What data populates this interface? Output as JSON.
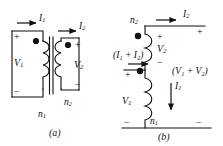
{
  "figure": {
    "title_hidden": "",
    "stroke_color": "#111111",
    "background": "#ffffff",
    "panels": [
      {
        "id": "panel-a",
        "caption": "(a)",
        "description": "Two-winding transformer with primary and secondary windings on a common core",
        "labels": {
          "current_primary": "I",
          "current_primary_sub": "1",
          "current_secondary": "I",
          "current_secondary_sub": "2",
          "voltage_primary": "V",
          "voltage_primary_sub": "1",
          "voltage_secondary": "V",
          "voltage_secondary_sub": "2",
          "turns_primary": "n",
          "turns_primary_sub": "1",
          "turns_secondary": "n",
          "turns_secondary_sub": "2",
          "plus_primary": "+",
          "minus_primary": "−",
          "plus_secondary": "+",
          "minus_secondary": "−"
        }
      },
      {
        "id": "panel-b",
        "caption": "(b)",
        "description": "Autotransformer connection with series-aiding windings",
        "labels": {
          "turns_upper": "n",
          "turns_upper_sub": "2",
          "turns_lower": "n",
          "turns_lower_sub": "1",
          "current_out": "I",
          "current_out_sub": "2",
          "current_in": "(I₁ + I₂)",
          "current_lower": "I",
          "current_lower_sub": "1",
          "voltage_upper": "V",
          "voltage_upper_sub": "2",
          "voltage_lower": "V",
          "voltage_lower_sub": "1",
          "voltage_total": "(V₁ + V₂)",
          "plus_top": "+",
          "plus_upper_coil": "+",
          "minus_upper_coil": "−",
          "plus_mid": "+",
          "minus_bottom_left": "−",
          "minus_bottom_right": "−"
        }
      }
    ],
    "symbols": {
      "polarity_dot": "dot-marker",
      "arrow": "current-arrow",
      "coil": "winding-coil",
      "core": "transformer-core"
    }
  }
}
